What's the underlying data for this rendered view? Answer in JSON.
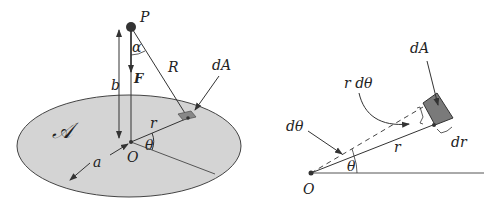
{
  "left_figure": {
    "labels": {
      "point_P": "P",
      "angle_alpha": "α",
      "distance_R": "R",
      "area_element": "dA",
      "height_b": "b",
      "force_F": "F",
      "region_A": "𝒜",
      "radius_r": "r",
      "angle_theta": "θ",
      "origin_O": "O",
      "disk_radius_a": "a"
    },
    "colors": {
      "disk_fill": "#d4d4d4",
      "stroke": "#333333",
      "element_fill": "#888888"
    }
  },
  "right_figure": {
    "labels": {
      "area_element": "dA",
      "arc_length": "r dθ",
      "angle_dtheta": "dθ",
      "radius_r": "r",
      "radial_width": "dr",
      "angle_theta": "θ",
      "origin_O": "O"
    },
    "colors": {
      "element_fill": "#7a7a7a",
      "stroke": "#333333"
    }
  }
}
